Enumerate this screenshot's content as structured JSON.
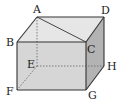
{
  "diagram": {
    "type": "rectangular cuboid",
    "vertices": {
      "A": {
        "label": "A",
        "x": 37,
        "y": 17
      },
      "B": {
        "label": "B",
        "x": 17,
        "y": 42
      },
      "C": {
        "label": "C",
        "x": 86,
        "y": 42
      },
      "D": {
        "label": "D",
        "x": 104,
        "y": 17
      },
      "E": {
        "label": "E",
        "x": 37,
        "y": 66
      },
      "F": {
        "label": "F",
        "x": 17,
        "y": 90
      },
      "G": {
        "label": "G",
        "x": 86,
        "y": 90
      },
      "H": {
        "label": "H",
        "x": 104,
        "y": 66
      }
    },
    "solid_edges": [
      "AB",
      "AD",
      "BC",
      "CD",
      "BF",
      "CG",
      "DH",
      "FG",
      "GH"
    ],
    "hidden_edges": [
      "AE",
      "EF",
      "EH"
    ],
    "diagonals": [
      "AC"
    ],
    "colors": {
      "top_face": "#e6e6e6",
      "front_face": "#d6d6d6",
      "right_face": "#b3b3b3",
      "edge": "#333333",
      "hidden_edge": "#666666"
    }
  }
}
